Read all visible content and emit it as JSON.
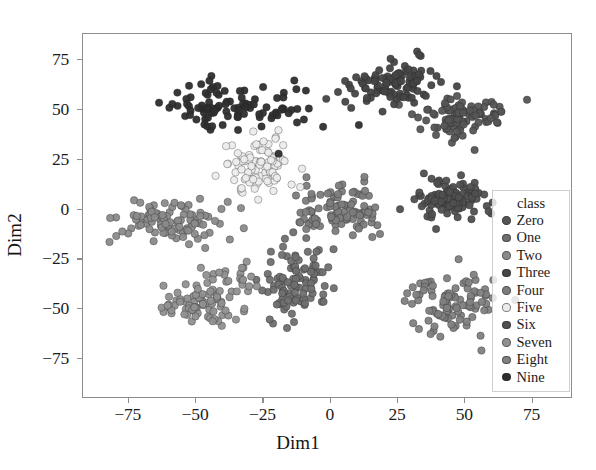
{
  "chart_data": {
    "type": "scatter",
    "title": "",
    "xlabel": "Dim1",
    "ylabel": "Dim2",
    "xlim": [
      -92,
      90
    ],
    "ylim": [
      -95,
      88
    ],
    "xticks": [
      -75,
      -50,
      -25,
      0,
      25,
      50,
      75
    ],
    "yticks": [
      -75,
      -50,
      -25,
      0,
      25,
      50,
      75
    ],
    "xticklabels": [
      "−75",
      "−50",
      "−25",
      "0",
      "25",
      "50",
      "75"
    ],
    "yticklabels": [
      "−75",
      "−50",
      "−25",
      "0",
      "25",
      "50",
      "75"
    ],
    "grid": false,
    "legend_position": "right-inside",
    "legend_title": "class",
    "marker_size": 7.5,
    "marker_opacity": 0.95,
    "series": [
      {
        "name": "Zero",
        "color": "#555555",
        "n": 100,
        "center": [
          56,
          42
        ],
        "spread": [
          17,
          11
        ],
        "seed": 11
      },
      {
        "name": "One",
        "color": "#6f6f6f",
        "n": 100,
        "center": [
          -12,
          -46
        ],
        "spread": [
          13,
          19
        ],
        "seed": 23
      },
      {
        "name": "Two",
        "color": "#8a8a8a",
        "n": 100,
        "center": [
          -55,
          -6
        ],
        "spread": [
          18,
          11
        ],
        "seed": 37
      },
      {
        "name": "Three",
        "color": "#454545",
        "n": 100,
        "center": [
          22,
          61
        ],
        "spread": [
          13,
          11
        ],
        "seed": 47
      },
      {
        "name": "Four",
        "color": "#7c7c7c",
        "n": 100,
        "center": [
          2,
          5
        ],
        "spread": [
          12,
          14
        ],
        "seed": 59
      },
      {
        "name": "Five",
        "color": "#ececec",
        "n": 100,
        "center": [
          -22,
          25
        ],
        "spread": [
          13,
          12
        ],
        "seed": 71
      },
      {
        "name": "Six",
        "color": "#4f4f4f",
        "n": 100,
        "center": [
          47,
          1
        ],
        "spread": [
          13,
          10
        ],
        "seed": 83
      },
      {
        "name": "Seven",
        "color": "#909090",
        "n": 100,
        "center": [
          -46,
          -44
        ],
        "spread": [
          14,
          12
        ],
        "seed": 97
      },
      {
        "name": "Eight",
        "color": "#808080",
        "n": 100,
        "center": [
          40,
          -57
        ],
        "spread": [
          18,
          17
        ],
        "seed": 109
      },
      {
        "name": "Nine",
        "color": "#2e2e2e",
        "n": 100,
        "center": [
          -32,
          55
        ],
        "spread": [
          22,
          14
        ],
        "seed": 127
      }
    ]
  },
  "legend": {
    "title": "class",
    "items": [
      {
        "label": "Zero",
        "color": "#555555"
      },
      {
        "label": "One",
        "color": "#6f6f6f"
      },
      {
        "label": "Two",
        "color": "#8a8a8a"
      },
      {
        "label": "Three",
        "color": "#454545"
      },
      {
        "label": "Four",
        "color": "#7c7c7c"
      },
      {
        "label": "Five",
        "color": "#ececec"
      },
      {
        "label": "Six",
        "color": "#4f4f4f"
      },
      {
        "label": "Seven",
        "color": "#909090"
      },
      {
        "label": "Eight",
        "color": "#808080"
      },
      {
        "label": "Nine",
        "color": "#2e2e2e"
      }
    ]
  }
}
